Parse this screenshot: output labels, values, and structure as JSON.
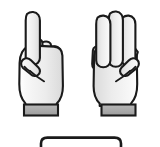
{
  "illustration": {
    "title": "Counting hands gesture",
    "description": "Two cartoon hands shown palm-out with extended fingers, above a partially visible rounded answer box",
    "background_color": "#ffffff",
    "outline_color": "#1a1a1a",
    "skin_fill_color": "#ededed",
    "skin_shadow_color": "#dcdcdc",
    "cuff_fill_color": "#a8a8a8",
    "total_count_label": "4"
  },
  "hands": [
    {
      "id": "left-hand",
      "side": "left",
      "fingers_extended": 1,
      "count_label": "1",
      "extended_finger_names": [
        "index"
      ],
      "folded_finger_names": [
        "middle",
        "ring",
        "pinky",
        "thumb"
      ],
      "has_cuff": true,
      "cuff_label": "sleeve-cuff"
    },
    {
      "id": "right-hand",
      "side": "right",
      "fingers_extended": 3,
      "count_label": "3",
      "extended_finger_names": [
        "index",
        "middle",
        "ring"
      ],
      "folded_finger_names": [
        "pinky",
        "thumb"
      ],
      "has_cuff": true,
      "cuff_label": "sleeve-cuff"
    }
  ],
  "answer_box": {
    "label": "answer-box",
    "value": "",
    "placeholder": "",
    "visible_portion": "top edge only, cropped by image bottom"
  }
}
